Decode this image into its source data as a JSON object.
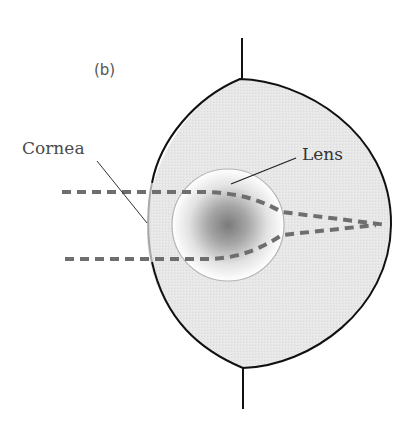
{
  "figure": {
    "panel_label": "(b)",
    "labels": {
      "cornea": "Cornea",
      "lens": "Lens"
    },
    "colors": {
      "eye_fill": "#e6e6e6",
      "eye_outline": "#111111",
      "cornea_line": "#a8a8a8",
      "lens_edge": "#b5b5b5",
      "lens_center": "#7a7a7a",
      "ray": "#6e6e6e",
      "leader_line": "#222222"
    },
    "rays": [
      {
        "name": "upper-ray",
        "description": "parallel ray entering above axis, refracted by lens toward focal point"
      },
      {
        "name": "lower-ray",
        "description": "parallel ray entering below axis, refracted by lens toward focal point"
      }
    ]
  }
}
